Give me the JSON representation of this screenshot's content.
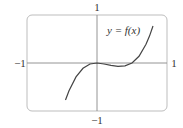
{
  "figure": {
    "equation_label": "y = f(x)",
    "tick_labels": {
      "x_min": "−1",
      "x_max": "1",
      "y_max": "1",
      "y_min": "−1"
    },
    "colors": {
      "frame": "#bdbdbd",
      "axes": "#888888",
      "curve": "#444444",
      "text": "#333333"
    }
  },
  "chart_data": {
    "type": "line",
    "title": "",
    "xlabel": "",
    "ylabel": "",
    "xlim": [
      -1,
      1
    ],
    "ylim": [
      -1,
      1
    ],
    "grid": false,
    "legend": "none",
    "annotations": [
      "y = f(x)"
    ],
    "series": [
      {
        "name": "y = f(x)",
        "x": [
          -0.45,
          -0.4,
          -0.3,
          -0.2,
          -0.1,
          0.0,
          0.1,
          0.2,
          0.3,
          0.4,
          0.5,
          0.6,
          0.7,
          0.75,
          0.8
        ],
        "y": [
          -0.77,
          -0.58,
          -0.29,
          -0.11,
          -0.02,
          0.0,
          -0.02,
          -0.05,
          -0.07,
          -0.06,
          0.0,
          0.14,
          0.39,
          0.56,
          0.77
        ]
      }
    ]
  }
}
